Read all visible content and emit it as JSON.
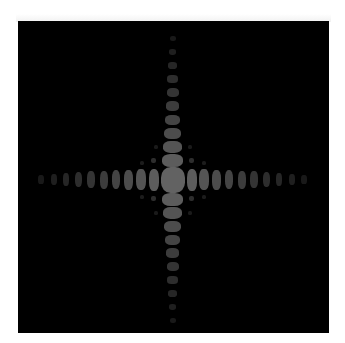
{
  "image": {
    "description": "Fraunhofer diffraction pattern of a rectangular aperture (sinc^2 cross pattern)",
    "background_color": "#ffffff",
    "panel": {
      "left": 18,
      "top": 21,
      "width": 311,
      "height": 312,
      "color": "#000000"
    },
    "center": {
      "x": 172.5,
      "y": 179.5
    },
    "central_lobe": {
      "w": 24,
      "h": 26,
      "gray": 98
    },
    "horizontal_lobes": {
      "count_per_side": 10,
      "offsets": [
        19,
        31.5,
        44,
        56.5,
        69,
        81.5,
        94,
        106.5,
        119,
        131.5
      ],
      "widths": [
        10,
        9.5,
        9,
        8.5,
        8,
        7.5,
        7,
        6.5,
        6,
        5.5
      ],
      "heights": [
        22,
        21,
        20,
        19,
        18,
        17,
        15,
        13,
        11,
        9
      ],
      "grays": [
        92,
        84,
        76,
        68,
        60,
        52,
        45,
        38,
        31,
        25
      ]
    },
    "vertical_lobes": {
      "count_per_side": 10,
      "offsets": [
        19.5,
        33,
        46.5,
        60,
        73.5,
        87,
        100.5,
        114,
        127.5,
        141
      ],
      "widths": [
        21,
        19,
        17,
        15,
        13.5,
        12,
        10.5,
        9,
        7.5,
        6
      ],
      "heights": [
        13,
        12,
        11,
        10,
        9.5,
        9,
        8,
        7,
        6,
        5
      ],
      "grays": [
        92,
        84,
        76,
        68,
        60,
        52,
        45,
        38,
        31,
        25
      ]
    },
    "diagonal_dots": [
      {
        "dx": -19,
        "dy": -19,
        "w": 5,
        "h": 5,
        "gray": 45
      },
      {
        "dx": 19,
        "dy": -19,
        "w": 5,
        "h": 5,
        "gray": 45
      },
      {
        "dx": -19,
        "dy": 19,
        "w": 5,
        "h": 5,
        "gray": 45
      },
      {
        "dx": 19,
        "dy": 19,
        "w": 5,
        "h": 5,
        "gray": 45
      },
      {
        "dx": -31,
        "dy": -17,
        "w": 4,
        "h": 4,
        "gray": 28
      },
      {
        "dx": 31,
        "dy": -17,
        "w": 4,
        "h": 4,
        "gray": 28
      },
      {
        "dx": -31,
        "dy": 17,
        "w": 4,
        "h": 4,
        "gray": 28
      },
      {
        "dx": 31,
        "dy": 17,
        "w": 4,
        "h": 4,
        "gray": 28
      },
      {
        "dx": -17,
        "dy": -33,
        "w": 4,
        "h": 4,
        "gray": 26
      },
      {
        "dx": 17,
        "dy": -33,
        "w": 4,
        "h": 4,
        "gray": 26
      },
      {
        "dx": -17,
        "dy": 33,
        "w": 4,
        "h": 4,
        "gray": 26
      },
      {
        "dx": 17,
        "dy": 33,
        "w": 4,
        "h": 4,
        "gray": 26
      }
    ]
  }
}
